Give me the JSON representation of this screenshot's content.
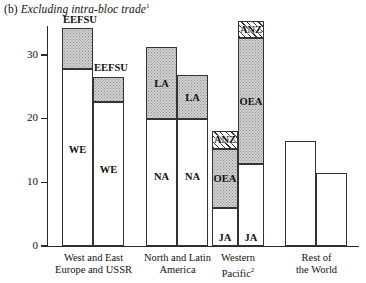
{
  "chart_data": {
    "type": "bar",
    "title": "(b) Excluding intra-bloc trade",
    "title_prefix": "(b)",
    "title_text": "Excluding intra-bloc trade",
    "title_footnote": "1",
    "xlabel": "",
    "ylabel": "",
    "ylim": [
      0,
      36
    ],
    "yticks": [
      0,
      10,
      20,
      30
    ],
    "ytick_labels": [
      "0",
      "10",
      "20",
      "30"
    ],
    "grid": false,
    "legend_position": "none",
    "stacked": true,
    "categories": [
      "West and East Europe and USSR",
      "North and Latin America",
      "Western Pacific",
      "Rest of the World"
    ],
    "groups": [
      {
        "name": "West and East Europe and USSR",
        "label_lines": [
          "West and East",
          "Europe and USSR"
        ],
        "footnote": "",
        "bars": [
          {
            "total": 34.2,
            "segments": [
              {
                "name": "WE",
                "label": "WE",
                "from": 0,
                "to": 27.8,
                "fill": "white"
              },
              {
                "name": "EEFSU",
                "label": "",
                "from": 27.8,
                "to": 34.2,
                "fill": "dotted"
              }
            ],
            "callout": "EEFSU"
          },
          {
            "total": 26.6,
            "segments": [
              {
                "name": "WE",
                "label": "WE",
                "from": 0,
                "to": 22.6,
                "fill": "white"
              },
              {
                "name": "EEFSU",
                "label": "",
                "from": 22.6,
                "to": 26.6,
                "fill": "dotted"
              }
            ],
            "callout": "EEFSU"
          }
        ]
      },
      {
        "name": "North and Latin America",
        "label_lines": [
          "North and Latin",
          "America"
        ],
        "footnote": "",
        "bars": [
          {
            "total": 31.2,
            "segments": [
              {
                "name": "NA",
                "label": "NA",
                "from": 0,
                "to": 19.9,
                "fill": "white"
              },
              {
                "name": "LA",
                "label": "LA",
                "from": 19.9,
                "to": 31.2,
                "fill": "dotted"
              }
            ],
            "callout": ""
          },
          {
            "total": 26.8,
            "segments": [
              {
                "name": "NA",
                "label": "NA",
                "from": 0,
                "to": 19.9,
                "fill": "white"
              },
              {
                "name": "LA",
                "label": "LA",
                "from": 19.9,
                "to": 26.8,
                "fill": "dotted"
              }
            ],
            "callout": ""
          }
        ]
      },
      {
        "name": "Western Pacific",
        "label_lines": [
          "Western",
          "Pacific"
        ],
        "footnote": "2",
        "bars": [
          {
            "total": 18.1,
            "segments": [
              {
                "name": "JA",
                "label": "JA",
                "from": 0,
                "to": 6.0,
                "fill": "white"
              },
              {
                "name": "OEA",
                "label": "OEA",
                "from": 6.0,
                "to": 15.2,
                "fill": "dotted"
              },
              {
                "name": "ANZ",
                "label": "ANZ",
                "from": 15.2,
                "to": 18.1,
                "fill": "hatched"
              }
            ],
            "callout": ""
          },
          {
            "total": 35.4,
            "segments": [
              {
                "name": "JA",
                "label": "JA",
                "from": 0,
                "to": 12.9,
                "fill": "white"
              },
              {
                "name": "OEA",
                "label": "OEA",
                "from": 12.9,
                "to": 32.6,
                "fill": "dotted"
              },
              {
                "name": "ANZ",
                "label": "ANZ",
                "from": 32.6,
                "to": 35.4,
                "fill": "hatched"
              }
            ],
            "callout": ""
          }
        ]
      },
      {
        "name": "Rest of the World",
        "label_lines": [
          "Rest of",
          "the World"
        ],
        "footnote": "",
        "bars": [
          {
            "total": 16.5,
            "segments": [
              {
                "name": "ROW",
                "label": "",
                "from": 0,
                "to": 16.5,
                "fill": "white"
              }
            ],
            "callout": ""
          },
          {
            "total": 11.4,
            "segments": [
              {
                "name": "ROW",
                "label": "",
                "from": 0,
                "to": 11.4,
                "fill": "white"
              }
            ],
            "callout": ""
          }
        ]
      }
    ],
    "series_keys": [
      "WE",
      "EEFSU",
      "NA",
      "LA",
      "JA",
      "OEA",
      "ANZ",
      "ROW"
    ],
    "fill_styles": {
      "white": "#ffffff",
      "dotted": "#d2d2d2",
      "hatched": "#ffffff"
    },
    "axis_color": "#2a2a2a",
    "bar_outline_color": "#333333"
  }
}
